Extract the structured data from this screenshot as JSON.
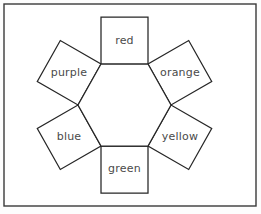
{
  "figure": {
    "frame": {
      "x": 4,
      "y": 4,
      "width": 252,
      "height": 202,
      "stroke_color": "#3a3a3a",
      "fill_color": "#ffffff"
    },
    "background_color": "#fdfdfd",
    "line_color": "#262626",
    "label_color": "#4a4a4a",
    "hexagon": {
      "name": "center-hexagon",
      "side_length": 47,
      "center_x": 124.5,
      "center_y": 105,
      "points": "101,64 148,64 171,105 148,146 101,146 78,105"
    },
    "squares": [
      {
        "id": "square-red",
        "label": "red",
        "edge_index": 0,
        "rotation_deg": 0,
        "points": "101,17 148,17 148,64 101,64",
        "label_x": 124.5,
        "label_y": 41
      },
      {
        "id": "square-orange",
        "label": "orange",
        "edge_index": 1,
        "rotation_deg": 60,
        "points": "148,64 171,105 211.7,81.5 188.7,40.5",
        "label_x": 180,
        "label_y": 73
      },
      {
        "id": "square-yellow",
        "label": "yellow",
        "edge_index": 2,
        "rotation_deg": 120,
        "points": "171,105 148,146 188.7,169.5 211.7,128.5",
        "label_x": 180,
        "label_y": 137
      },
      {
        "id": "square-green",
        "label": "green",
        "edge_index": 3,
        "rotation_deg": 0,
        "points": "148,146 101,146 101,193 148,193",
        "label_x": 124.5,
        "label_y": 169
      },
      {
        "id": "square-blue",
        "label": "blue",
        "edge_index": 4,
        "rotation_deg": 60,
        "points": "101,146 78,105 37.3,128.5 60.3,169.5",
        "label_x": 69,
        "label_y": 137
      },
      {
        "id": "square-purple",
        "label": "purple",
        "edge_index": 5,
        "rotation_deg": 120,
        "points": "78,105 101,64 60.3,40.5 37.3,81.5",
        "label_x": 69,
        "label_y": 73
      }
    ]
  }
}
